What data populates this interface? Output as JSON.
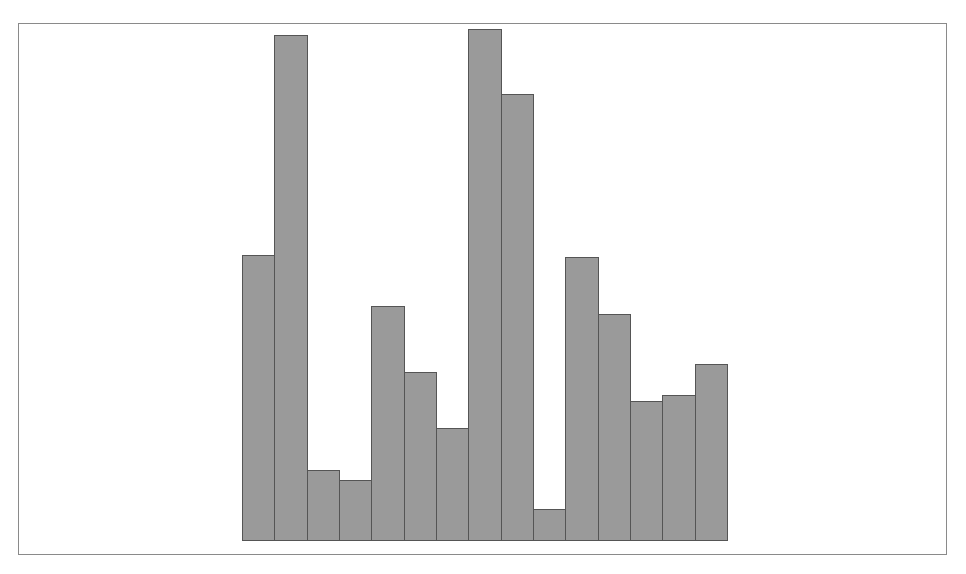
{
  "chart_data": {
    "type": "bar",
    "title": "",
    "xlabel": "",
    "ylabel": "",
    "grid": false,
    "legend": null,
    "categories": [
      "1",
      "2",
      "3",
      "4",
      "5",
      "6",
      "7",
      "8",
      "9",
      "10",
      "11",
      "12",
      "13",
      "14",
      "15"
    ],
    "values": [
      285,
      505,
      71,
      61,
      235,
      169,
      113,
      511,
      446,
      32,
      283,
      227,
      140,
      146,
      177
    ],
    "ylim": [
      0,
      520
    ],
    "bar_color": "#9a9a9a",
    "edge_color": "#555555"
  }
}
